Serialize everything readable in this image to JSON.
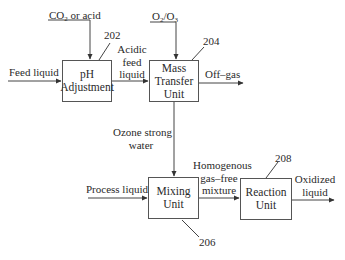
{
  "diagram": {
    "type": "process-flow",
    "units": [
      {
        "id": "ph",
        "ref": "202",
        "lines": [
          "pH",
          "Adjustment"
        ]
      },
      {
        "id": "mtu",
        "ref": "204",
        "lines": [
          "Mass",
          "Transfer",
          "Unit"
        ]
      },
      {
        "id": "mix",
        "ref": "206",
        "lines": [
          "Mixing",
          "Unit"
        ]
      },
      {
        "id": "react",
        "ref": "208",
        "lines": [
          "Reaction",
          "Unit"
        ]
      }
    ],
    "streams": {
      "co2_prefix": "CO",
      "co2_sub": "2",
      "co2_suffix": " or acid",
      "o2_a": "O",
      "o2_a_sub": "2",
      "o2_mid": "/O",
      "o2_b_sub": "3",
      "feed_liquid": "Feed liquid",
      "acidic_feed": [
        "Acidic",
        "feed",
        "liquid"
      ],
      "off_gas": "Off–gas",
      "ozone_water": [
        "Ozone strong",
        "water"
      ],
      "process_liquid": "Process liquid",
      "homogenous": [
        "Homogenous",
        "gas–free",
        "mixture"
      ],
      "oxidized": [
        "Oxidized",
        "liquid"
      ]
    }
  }
}
